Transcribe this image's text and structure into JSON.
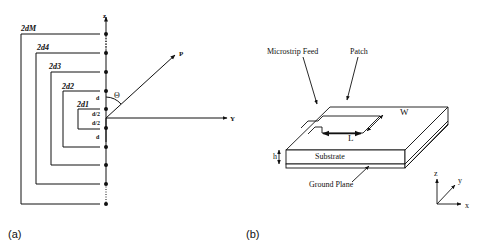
{
  "panel_a": {
    "label": "(a)",
    "axis_z_label": "z",
    "axis_y_label": "Y",
    "point_label": "P",
    "angle_label": "Θ",
    "spacing_labels": [
      "d",
      "d/2",
      "d/2",
      "d"
    ],
    "pair_labels": [
      "2d1",
      "2d2",
      "2d3",
      "2d4",
      "2dM"
    ]
  },
  "panel_b": {
    "label": "(b)",
    "microstrip_feed_label": "Microstrip Feed",
    "patch_label": "Patch",
    "width_label": "W",
    "length_label": "L",
    "height_label": "h",
    "substrate_label": "Substrate",
    "ground_plane_label": "Ground Plane",
    "axes": {
      "z": "z",
      "y": "y",
      "x": "x"
    }
  },
  "colors": {
    "line": "#111111",
    "background": "#ffffff"
  }
}
